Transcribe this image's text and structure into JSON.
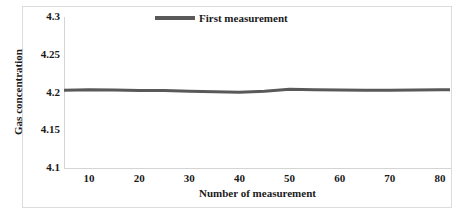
{
  "chart_data": {
    "type": "line",
    "title": "",
    "xlabel": "Number of measurement",
    "ylabel": "Gas concentration",
    "xlim": [
      5,
      82
    ],
    "ylim": [
      4.1,
      4.3
    ],
    "xticks": [
      "10",
      "20",
      "30",
      "40",
      "50",
      "60",
      "70",
      "80"
    ],
    "xtick_values": [
      10,
      20,
      30,
      40,
      50,
      60,
      70,
      80
    ],
    "yticks": [
      "4.1",
      "4.15",
      "4.2",
      "4.25",
      "4.3"
    ],
    "ytick_values": [
      4.1,
      4.15,
      4.2,
      4.25,
      4.3
    ],
    "grid": false,
    "legend_position": "top-center",
    "series": [
      {
        "name": "First measurement",
        "color": "#595959",
        "line_width": 3,
        "x": [
          5,
          10,
          15,
          20,
          25,
          30,
          35,
          40,
          45,
          50,
          55,
          60,
          65,
          70,
          75,
          80,
          82
        ],
        "values": [
          4.203,
          4.2035,
          4.2032,
          4.2028,
          4.2025,
          4.2018,
          4.201,
          4.2002,
          4.2018,
          4.2042,
          4.2038,
          4.2032,
          4.203,
          4.203,
          4.2032,
          4.2035,
          4.2035
        ]
      }
    ]
  },
  "legend": {
    "entries": [
      {
        "label": "First measurement",
        "color": "#595959"
      }
    ]
  },
  "axes": {
    "y_title": "Gas concentration",
    "x_title": "Number of measurement",
    "axis_line_color": "#d4d4d4",
    "frame_color": "#dcdcdc",
    "text_color": "#1a1a1a"
  }
}
